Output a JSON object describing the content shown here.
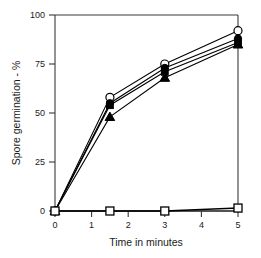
{
  "chart_data": {
    "type": "line",
    "title": "",
    "subtitle": "",
    "xlabel": "Time in minutes",
    "ylabel": "Spore germination - %",
    "xlim": [
      0,
      5
    ],
    "ylim": [
      0,
      100
    ],
    "xticks": [
      0,
      1,
      2,
      3,
      4,
      5
    ],
    "xtick_labels": [
      "0",
      "1",
      "2",
      "3",
      "4",
      "5"
    ],
    "yticks": [
      0,
      25,
      50,
      75,
      100
    ],
    "ytick_labels": [
      "0",
      "25",
      "50",
      "75",
      "100"
    ],
    "grid": false,
    "legend": "none",
    "x": [
      0,
      1.5,
      3,
      5
    ],
    "series": [
      {
        "name": "open-circle",
        "marker": "circle-open",
        "color": "#000000",
        "values": [
          0,
          58,
          75,
          92
        ]
      },
      {
        "name": "filled-circle",
        "marker": "circle-filled",
        "color": "#000000",
        "values": [
          0,
          55,
          73,
          88
        ]
      },
      {
        "name": "filled-square",
        "marker": "square-filled",
        "color": "#000000",
        "values": [
          0,
          54,
          71,
          86
        ]
      },
      {
        "name": "filled-triangle",
        "marker": "triangle-filled",
        "color": "#000000",
        "values": [
          0,
          48,
          68,
          85
        ]
      },
      {
        "name": "open-square-control",
        "marker": "square-open",
        "color": "#000000",
        "values": [
          0,
          0,
          0,
          1.5
        ]
      }
    ]
  },
  "axes": {
    "line_color": "#3a3a3a",
    "tick_color": "#3a3a3a"
  }
}
